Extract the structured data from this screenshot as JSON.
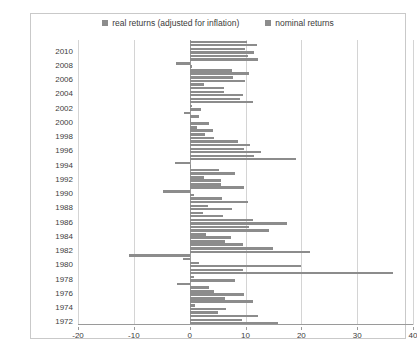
{
  "chart_data": {
    "type": "bar",
    "orientation": "horizontal",
    "title": "",
    "xlabel": "",
    "ylabel": "",
    "xlim": [
      -20,
      40
    ],
    "xticks": [
      -20,
      -10,
      0,
      10,
      20,
      30,
      40
    ],
    "grid": true,
    "legend_position": "top",
    "legend": [
      "real returns (adjusted for inflation)",
      "nominal returns"
    ],
    "categories": [
      2011,
      2010,
      2009,
      2008,
      2007,
      2006,
      2005,
      2004,
      2003,
      2002,
      2001,
      2000,
      1999,
      1998,
      1997,
      1996,
      1995,
      1994,
      1993,
      1992,
      1991,
      1990,
      1989,
      1988,
      1987,
      1986,
      1985,
      1984,
      1983,
      1982,
      1981,
      1980,
      1979,
      1978,
      1977,
      1976,
      1975,
      1974,
      1973,
      1972
    ],
    "tick_categories": [
      2010,
      2008,
      2006,
      2004,
      2002,
      2000,
      1998,
      1996,
      1994,
      1992,
      1990,
      1988,
      1986,
      1984,
      1982,
      1980,
      1978,
      1976,
      1974,
      1972
    ],
    "series": [
      {
        "name": "real returns (adjusted for inflation)",
        "values": [
          10.2,
          10.0,
          10.5,
          -2.4,
          7.5,
          7.8,
          2.6,
          6.2,
          9.0,
          0.4,
          -1.1,
          0.1,
          1.4,
          2.7,
          8.6,
          9.8,
          11.5,
          -2.6,
          5.2,
          2.6,
          5.7,
          -4.8,
          5.8,
          3.2,
          2.4,
          11.3,
          10.7,
          3.0,
          6.3,
          15.0,
          -10.8,
          1.7,
          9.6,
          0.7,
          -2.3,
          4.3,
          6.3,
          1.0,
          5.0,
          9.3
        ]
      },
      {
        "name": "nominal returns",
        "values": [
          12.1,
          11.5,
          12.3,
          0.5,
          10.7,
          10.0,
          6.1,
          9.6,
          11.3,
          2.0,
          1.7,
          3.5,
          4.2,
          4.3,
          10.8,
          12.8,
          19.0,
          0.3,
          8.2,
          5.6,
          9.8,
          0.8,
          10.5,
          7.5,
          6.0,
          17.5,
          14.3,
          7.4,
          9.5,
          21.5,
          -1.2,
          20.0,
          36.5,
          8.2,
          3.5,
          9.8,
          11.3,
          6.5,
          12.2,
          15.9
        ]
      }
    ],
    "colors": {
      "real": "#8c8c8c",
      "nominal": "#8c8c8c",
      "grid": "#d4d4d4",
      "axis": "#9a9a9a",
      "border": "#c9c9c9",
      "text": "#404040",
      "background": "#ffffff"
    }
  }
}
